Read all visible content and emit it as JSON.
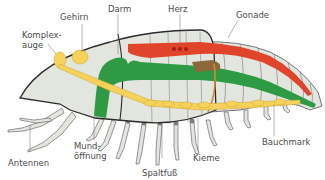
{
  "diagram": {
    "labels": {
      "gehirn": "Gehirn",
      "darm": "Darm",
      "herz": "Herz",
      "gonade": "Gonade",
      "komplexauge_1": "Komplex-",
      "komplexauge_2": "auge",
      "mundoeffnung_1": "Mund-",
      "mundoeffnung_2": "öffnung",
      "antennen": "Antennen",
      "spaltfuss": "Spaltfuß",
      "kieme": "Kieme",
      "bauchmark": "Bauchmark"
    },
    "colors": {
      "body": "#e3e5df",
      "outline": "#2b2b2b",
      "gut": "#2f9a44",
      "heart": "#e0442a",
      "nerve": "#f7d25a",
      "gonad": "#8a6a3a",
      "gonad_dots": "#d9b46a",
      "heart_dots": "#a51c1c",
      "leader": "#6a6a6a"
    }
  }
}
